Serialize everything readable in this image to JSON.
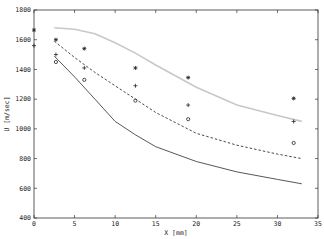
{
  "chart_data": {
    "type": "line",
    "title": "",
    "xlabel": "X [mm]",
    "ylabel": "U [m/sec]",
    "xlim": [
      0,
      35
    ],
    "ylim": [
      400,
      1800
    ],
    "xticks": [
      0,
      5,
      10,
      15,
      20,
      25,
      30,
      35
    ],
    "yticks": [
      400,
      600,
      800,
      1000,
      1200,
      1400,
      1600,
      1800
    ],
    "grid": false,
    "legend": null,
    "series": [
      {
        "name": "upper-curve",
        "kind": "line",
        "style": "solid-light-gray",
        "color": "#c8c8c8",
        "x": [
          2.5,
          5,
          7.5,
          10,
          12.5,
          15,
          20,
          25,
          30,
          33
        ],
        "y": [
          1680,
          1670,
          1640,
          1580,
          1510,
          1430,
          1280,
          1160,
          1090,
          1050
        ]
      },
      {
        "name": "middle-curve",
        "kind": "line",
        "style": "dashed",
        "color": "#333333",
        "x": [
          2.5,
          5,
          7.5,
          10,
          12.5,
          15,
          20,
          25,
          30,
          33
        ],
        "y": [
          1590,
          1480,
          1380,
          1290,
          1200,
          1110,
          970,
          890,
          830,
          800
        ]
      },
      {
        "name": "lower-curve",
        "kind": "line",
        "style": "solid",
        "color": "#444444",
        "x": [
          2.5,
          5,
          7.5,
          10,
          12.5,
          15,
          20,
          25,
          30,
          33
        ],
        "y": [
          1490,
          1350,
          1200,
          1050,
          960,
          880,
          780,
          710,
          660,
          630
        ]
      },
      {
        "name": "star-markers",
        "kind": "scatter",
        "marker": "*",
        "x": [
          0,
          2.7,
          6.2,
          12.5,
          19,
          32
        ],
        "y": [
          1665,
          1600,
          1540,
          1410,
          1345,
          1205
        ]
      },
      {
        "name": "plus-markers",
        "kind": "scatter",
        "marker": "+",
        "x": [
          0,
          2.7,
          6.2,
          12.5,
          19,
          32
        ],
        "y": [
          1560,
          1500,
          1410,
          1290,
          1160,
          1050
        ]
      },
      {
        "name": "circle-markers",
        "kind": "scatter",
        "marker": "o",
        "x": [
          2.7,
          6.2,
          12.5,
          19,
          32
        ],
        "y": [
          1450,
          1330,
          1190,
          1065,
          905
        ]
      }
    ]
  }
}
